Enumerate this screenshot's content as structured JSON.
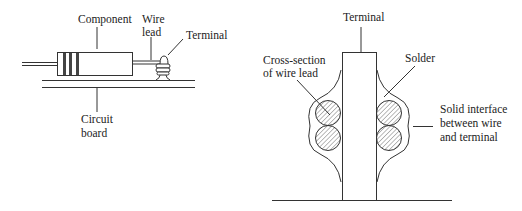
{
  "left_diagram": {
    "title": "Component mounted on circuit board",
    "labels": {
      "component": "Component",
      "wire_lead_1": "Wire",
      "wire_lead_2": "lead",
      "terminal": "Terminal",
      "circuit_board_1": "Circuit",
      "circuit_board_2": "board"
    }
  },
  "right_diagram": {
    "title": "Solder joint cross-section",
    "labels": {
      "terminal": "Terminal",
      "cross_section_1": "Cross-section",
      "cross_section_2": "of wire lead",
      "solder": "Solder",
      "solid_interface_1": "Solid interface",
      "solid_interface_2": "between wire",
      "solid_interface_3": "and terminal"
    }
  },
  "colors": {
    "line": "#333333",
    "band": "#444444",
    "background": "#ffffff"
  }
}
